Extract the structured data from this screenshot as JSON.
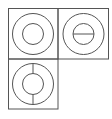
{
  "diagram": {
    "stroke_color": "#555555",
    "background": "#ffffff",
    "cells": [
      {
        "id": "top-left",
        "x": 8,
        "y": 8,
        "w": 50,
        "h": 51,
        "glyph": "concentric-circles",
        "divider": "none"
      },
      {
        "id": "top-right",
        "x": 58,
        "y": 8,
        "w": 51,
        "h": 51,
        "glyph": "concentric-circles-horizontal-bar",
        "divider": "horizontal"
      },
      {
        "id": "bottom-left",
        "x": 8,
        "y": 59,
        "w": 50,
        "h": 50,
        "glyph": "concentric-circles-vertical-bar",
        "divider": "vertical"
      }
    ],
    "outer_radius": 20.5,
    "inner_radius": 10.5
  }
}
